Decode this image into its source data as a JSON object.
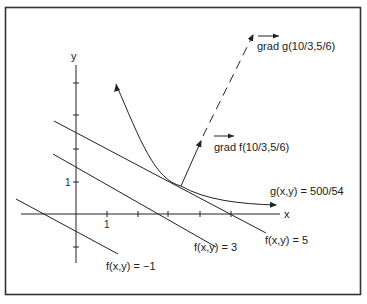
{
  "figure": {
    "colors": {
      "ink": "#222222",
      "frame": "#333333",
      "background": "#ffffff"
    },
    "axes": {
      "x_label": "x",
      "y_label": "y",
      "x_tick_label": "1",
      "y_tick_label": "1"
    },
    "level_lines": [
      {
        "label": "f(x,y) = 5"
      },
      {
        "label": "f(x,y) = 3"
      },
      {
        "label": "f(x,y) = −1"
      }
    ],
    "constraint_curve": {
      "label": "g(x,y) = 500/54"
    },
    "vectors": {
      "grad_f": {
        "label": "grad f(10/3,5/6)"
      },
      "grad_g": {
        "label": "grad g(10/3,5/6)"
      }
    }
  }
}
